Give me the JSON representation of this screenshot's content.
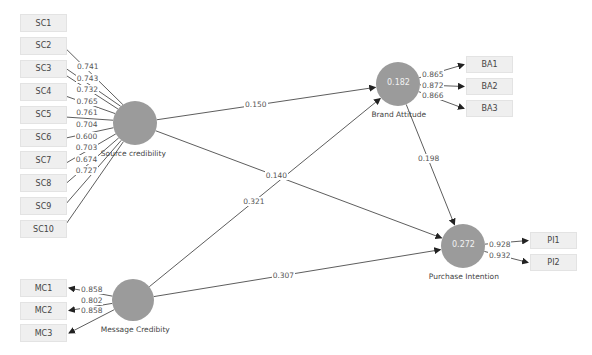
{
  "colors": {
    "construct_fill": "#9b9b9b",
    "indicator_fill": "#efefef",
    "line": "#333333"
  },
  "constructs": [
    {
      "id": "sc",
      "label": "Source credibility",
      "r2": "",
      "cx": 135,
      "cy": 123,
      "r": 22
    },
    {
      "id": "mc",
      "label": "Message Credibity",
      "r2": "",
      "cx": 133,
      "cy": 300,
      "r": 21
    },
    {
      "id": "ba",
      "label": "Brand Attitude",
      "r2": "0.182",
      "cx": 398,
      "cy": 84,
      "r": 22
    },
    {
      "id": "pi",
      "label": "Purchase Intention",
      "r2": "0.272",
      "cx": 463,
      "cy": 246,
      "r": 22
    }
  ],
  "indicators": {
    "sc": [
      {
        "label": "SC1",
        "loading": "0.741"
      },
      {
        "label": "SC2",
        "loading": "0.743"
      },
      {
        "label": "SC3",
        "loading": "0.732"
      },
      {
        "label": "SC4",
        "loading": "0.765"
      },
      {
        "label": "SC5",
        "loading": "0.761"
      },
      {
        "label": "SC6",
        "loading": "0.704"
      },
      {
        "label": "SC7",
        "loading": "0.600"
      },
      {
        "label": "SC8",
        "loading": "0.703"
      },
      {
        "label": "SC9",
        "loading": "0.674"
      },
      {
        "label": "SC10",
        "loading": "0.727"
      }
    ],
    "mc": [
      {
        "label": "MC1",
        "loading": "0.858"
      },
      {
        "label": "MC2",
        "loading": "0.802"
      },
      {
        "label": "MC3",
        "loading": "0.858"
      }
    ],
    "ba": [
      {
        "label": "BA1",
        "loading": "0.865"
      },
      {
        "label": "BA2",
        "loading": "0.872"
      },
      {
        "label": "BA3",
        "loading": "0.866"
      }
    ],
    "pi": [
      {
        "label": "PI1",
        "loading": "0.928"
      },
      {
        "label": "PI2",
        "loading": "0.932"
      }
    ]
  },
  "paths": [
    {
      "from": "sc",
      "to": "ba",
      "coef": "0.150"
    },
    {
      "from": "sc",
      "to": "pi",
      "coef": "0.140"
    },
    {
      "from": "mc",
      "to": "ba",
      "coef": "0.321"
    },
    {
      "from": "mc",
      "to": "pi",
      "coef": "0.307"
    },
    {
      "from": "ba",
      "to": "pi",
      "coef": "0.198"
    }
  ]
}
